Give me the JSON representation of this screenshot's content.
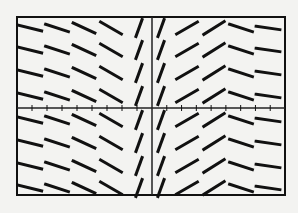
{
  "chart_data": {
    "type": "slope_field",
    "title": "",
    "xlabel": "",
    "ylabel": "",
    "grid": false,
    "legend": null,
    "frame": {
      "left": 17,
      "top": 17,
      "right": 285,
      "bottom": 195
    },
    "axes": {
      "x_axis_y": 108,
      "y_axis_x": 152
    },
    "x_ticks_count_per_side": 8,
    "columns_x": [
      30,
      57,
      84,
      111,
      139,
      161,
      187,
      214,
      241,
      268
    ],
    "rows_y": [
      28,
      50,
      73,
      96,
      120,
      143,
      166,
      188
    ],
    "column_slope_angles_deg": [
      -14,
      -18,
      -25,
      -30,
      -22,
      70,
      30,
      32,
      -18,
      -8
    ],
    "segment_length": 24,
    "colors": {
      "background": "#f3f3f1",
      "ink": "#111111"
    }
  }
}
